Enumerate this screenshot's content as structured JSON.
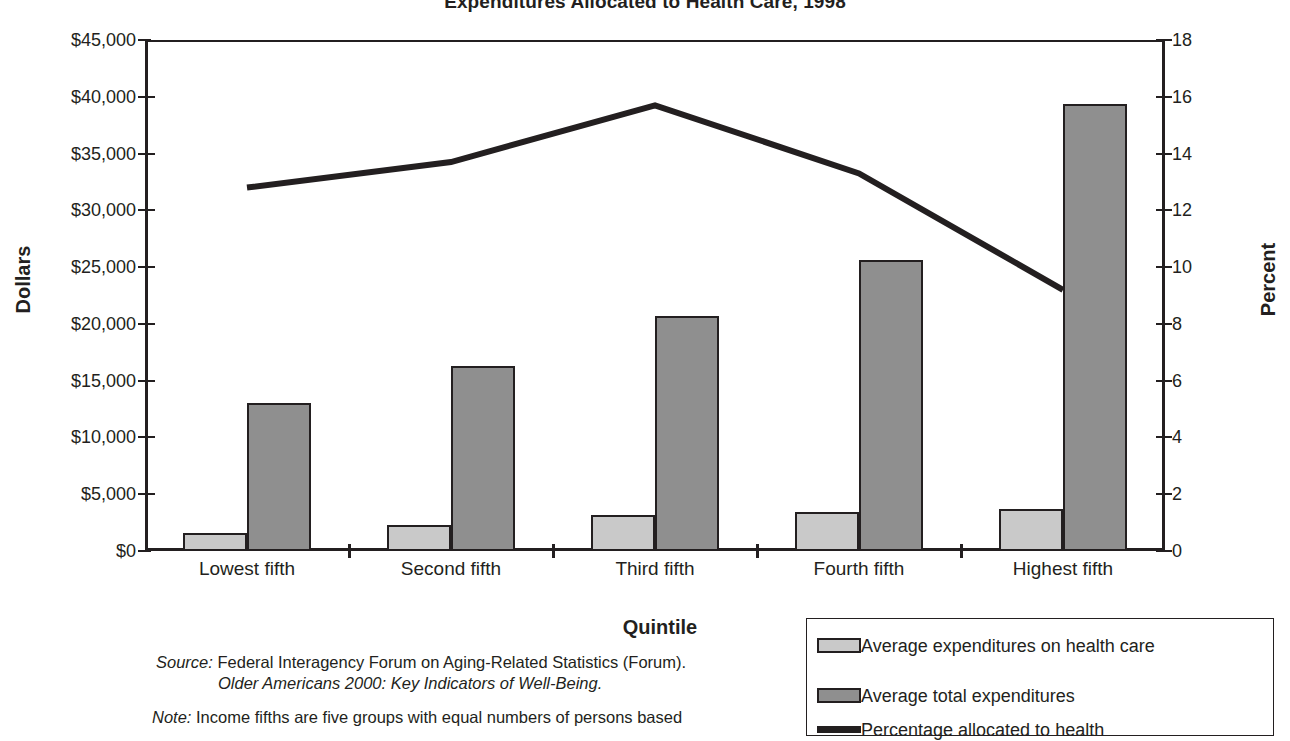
{
  "title": "Expenditures Allocated to Health Care, 1998",
  "axes": {
    "left_label": "Dollars",
    "right_label": "Percent",
    "x_label": "Quintile",
    "left_ticks": [
      "$0",
      "$5,000",
      "$10,000",
      "$15,000",
      "$20,000",
      "$25,000",
      "$30,000",
      "$35,000",
      "$40,000",
      "$45,000"
    ],
    "right_ticks": [
      "0",
      "2",
      "4",
      "6",
      "8",
      "10",
      "12",
      "14",
      "16",
      "18"
    ]
  },
  "legend": {
    "items": [
      {
        "name": "legend-health-care",
        "label": "Average expenditures on health care",
        "swatch": "health"
      },
      {
        "name": "legend-total",
        "label": "Average total expenditures",
        "swatch": "total"
      },
      {
        "name": "legend-percentage",
        "label": "Percentage allocated to health",
        "swatch": "line"
      }
    ]
  },
  "footnotes": {
    "source_label": "Source:",
    "source_line1": " Federal Interagency Forum on Aging-Related Statistics (Forum).",
    "source_line2": "Older Americans 2000: Key Indicators of Well-Being.",
    "note_label": "Note:",
    "note_line1": " Income fifths are five groups with equal numbers of persons based"
  },
  "chart_data": {
    "type": "bar",
    "title": "Expenditures Allocated to Health Care, 1998",
    "xlabel": "Quintile",
    "ylabel": "Dollars",
    "y2label": "Percent",
    "categories": [
      "Lowest fifth",
      "Second fifth",
      "Third fifth",
      "Fourth fifth",
      "Highest fifth"
    ],
    "ylim": [
      0,
      45000
    ],
    "y2lim": [
      0,
      18
    ],
    "ytick_step": 5000,
    "y2tick_step": 2,
    "grid": false,
    "legend_position": "bottom-right",
    "series": [
      {
        "name": "Average expenditures on health care",
        "type": "bar",
        "axis": "left",
        "color": "#c9c9c9",
        "values": [
          1600,
          2300,
          3200,
          3450,
          3700
        ]
      },
      {
        "name": "Average total expenditures",
        "type": "bar",
        "axis": "left",
        "color": "#8f8f8f",
        "values": [
          13000,
          16300,
          20700,
          25600,
          39400
        ]
      },
      {
        "name": "Percentage allocated to health",
        "type": "line",
        "axis": "right",
        "color": "#231f20",
        "values": [
          12.8,
          13.7,
          15.7,
          13.3,
          9.2
        ]
      }
    ]
  }
}
